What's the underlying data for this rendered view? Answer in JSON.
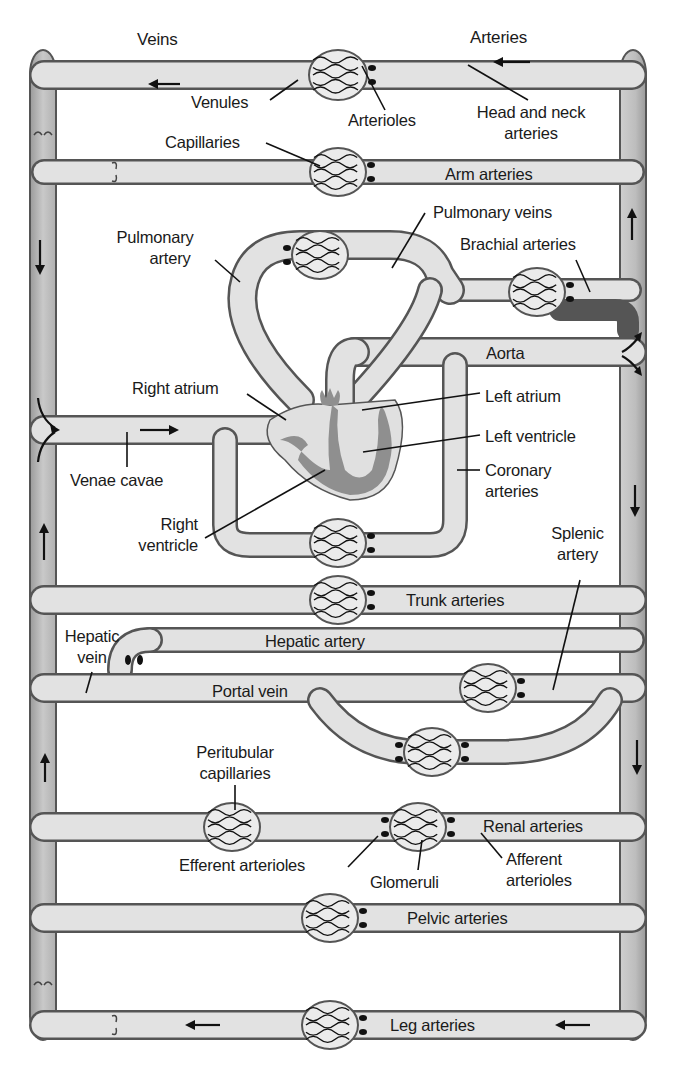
{
  "colors": {
    "vessel_fill": "#e0e0e0",
    "vessel_shadow": "#a8a8a8",
    "vessel_outline": "#555555",
    "heart_wall": "#8f8f8f",
    "label_text": "#1a1a1a",
    "background": "#ffffff"
  },
  "labels": {
    "veins": "Veins",
    "arteries": "Arteries",
    "venules": "Venules",
    "arterioles": "Arterioles",
    "head_neck_1": "Head and neck",
    "head_neck_2": "arteries",
    "capillaries": "Capillaries",
    "arm_arteries": "Arm arteries",
    "pulmonary_veins": "Pulmonary veins",
    "pulmonary_artery_1": "Pulmonary",
    "pulmonary_artery_2": "artery",
    "brachial_arteries": "Brachial arteries",
    "aorta": "Aorta",
    "right_atrium": "Right atrium",
    "left_atrium": "Left atrium",
    "left_ventricle": "Left ventricle",
    "venae_cavae": "Venae cavae",
    "coronary_1": "Coronary",
    "coronary_2": "arteries",
    "right_ventricle_1": "Right",
    "right_ventricle_2": "ventricle",
    "splenic_1": "Splenic",
    "splenic_2": "artery",
    "trunk_arteries": "Trunk arteries",
    "hepatic_vein_1": "Hepatic",
    "hepatic_vein_2": "vein",
    "hepatic_artery": "Hepatic artery",
    "portal_vein": "Portal vein",
    "peritubular_1": "Peritubular",
    "peritubular_2": "capillaries",
    "renal_arteries": "Renal arteries",
    "efferent_arterioles": "Efferent arterioles",
    "glomeruli": "Glomeruli",
    "afferent_1": "Afferent",
    "afferent_2": "arterioles",
    "pelvic_arteries": "Pelvic arteries",
    "leg_arteries": "Leg arteries"
  },
  "flow_arrows": [
    {
      "location": "top-left vein",
      "direction": "left"
    },
    {
      "location": "top-right artery",
      "direction": "left"
    },
    {
      "location": "right column upper",
      "direction": "up"
    },
    {
      "location": "left column upper",
      "direction": "down"
    },
    {
      "location": "venae cavae",
      "direction": "right"
    },
    {
      "location": "left column lower",
      "direction": "up"
    },
    {
      "location": "right column middle",
      "direction": "down"
    },
    {
      "location": "left column bottom",
      "direction": "up"
    },
    {
      "location": "bottom-left vein",
      "direction": "left"
    },
    {
      "location": "bottom-right artery",
      "direction": "left"
    }
  ]
}
